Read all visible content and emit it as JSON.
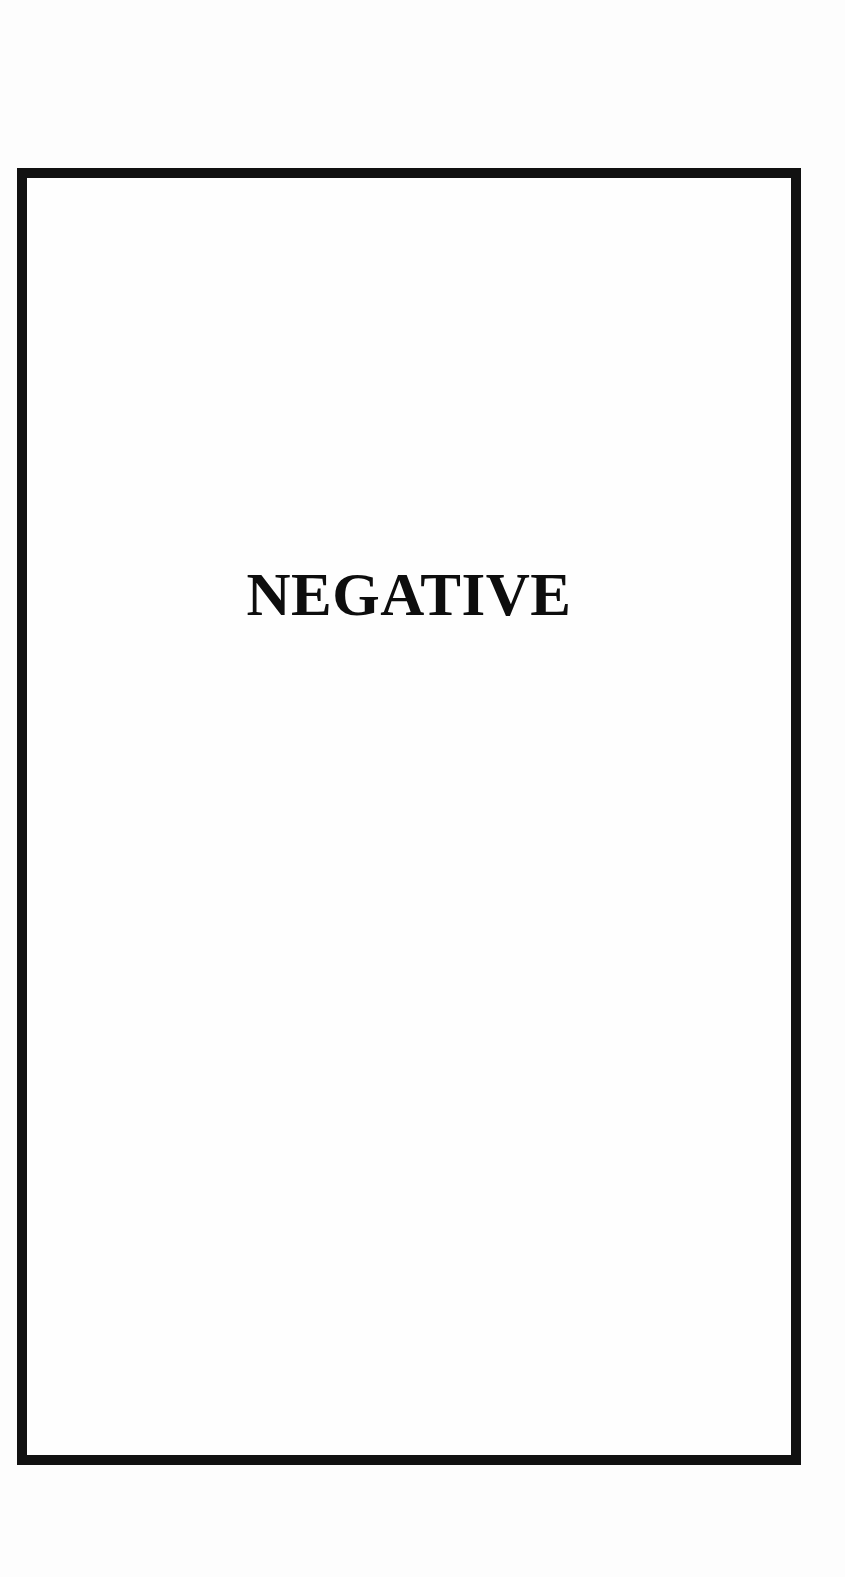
{
  "document": {
    "result_label": "NEGATIVE"
  },
  "colors": {
    "border": "#111111",
    "text": "#0d0d0d",
    "background": "#fdfdfd"
  }
}
